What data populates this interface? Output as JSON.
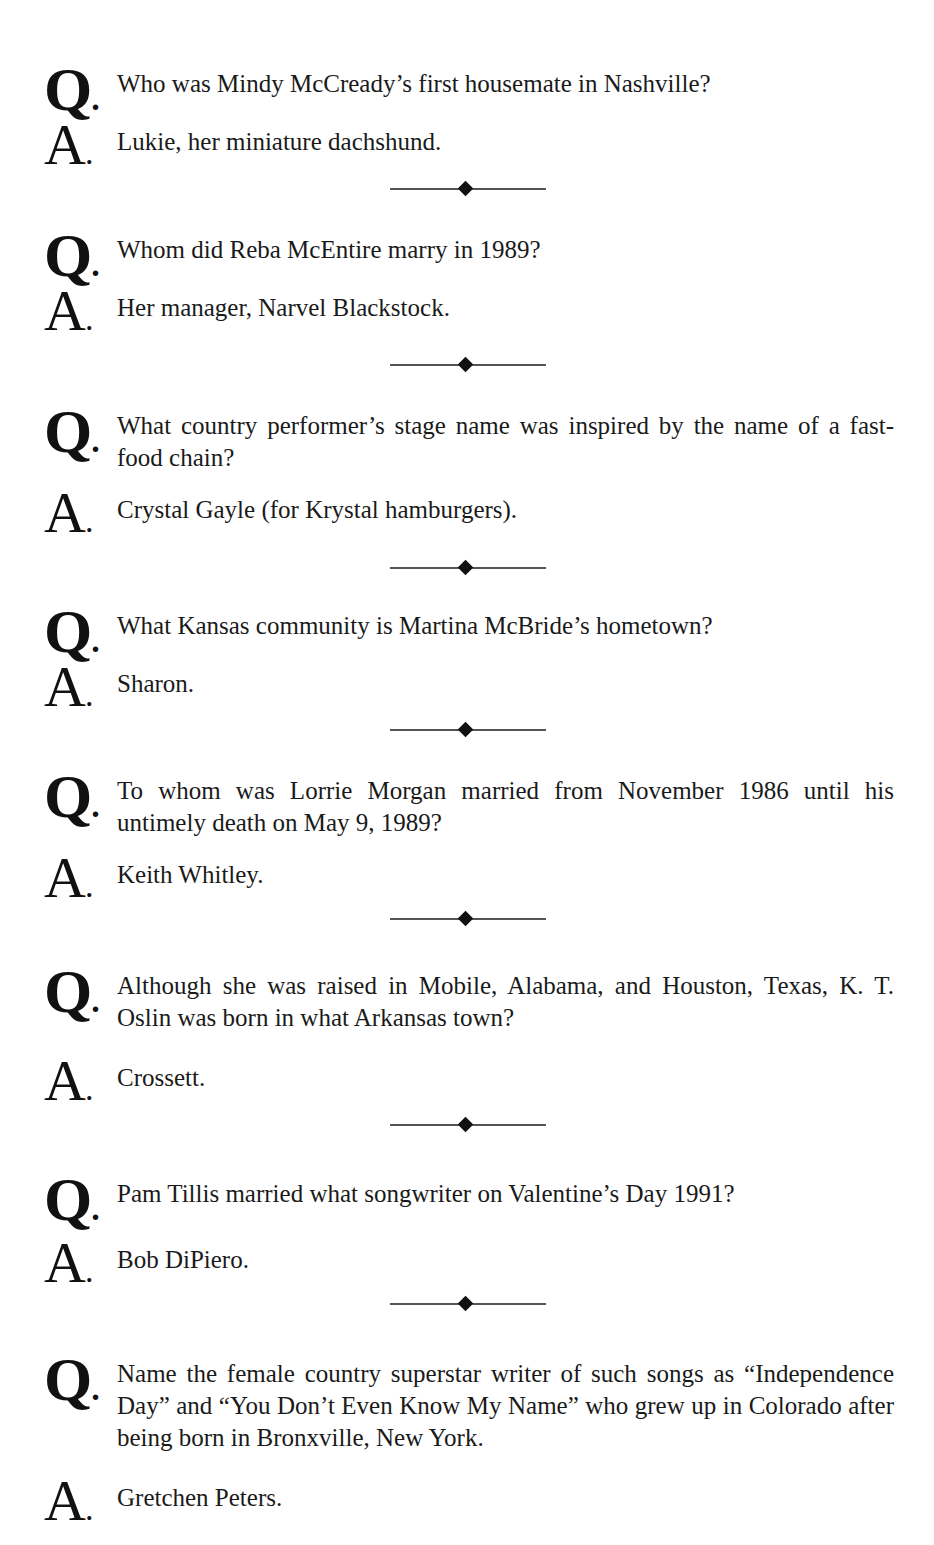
{
  "page": {
    "question_marker": "Q",
    "answer_marker": "A",
    "marker_suffix": ".",
    "divider_icon": "diamond-rule",
    "text_color": "#1a1a1a",
    "divider_line_color": "#555555",
    "divider_diamond_color": "#111111"
  },
  "qa_items": [
    {
      "question": "Who was Mindy McCready’s first housemate in Nashville?",
      "answer": "Lukie, her miniature dachshund."
    },
    {
      "question": "Whom did Reba McEntire marry in 1989?",
      "answer": "Her manager, Narvel Blackstock."
    },
    {
      "question": "What country performer’s stage name was inspired by the name of a fast-food chain?",
      "answer": "Crystal Gayle (for Krystal hamburgers)."
    },
    {
      "question": "What Kansas community is Martina McBride’s hometown?",
      "answer": "Sharon."
    },
    {
      "question": "To whom was Lorrie Morgan married from November 1986 until his untimely death on May 9, 1989?",
      "answer": "Keith Whitley."
    },
    {
      "question": "Although she was raised in Mobile, Alabama, and Houston, Texas, K. T. Oslin was born in what Arkansas town?",
      "answer": "Crossett."
    },
    {
      "question": "Pam Tillis married what songwriter on Valentine’s Day 1991?",
      "answer": "Bob DiPiero."
    },
    {
      "question": "Name the female country superstar writer of such songs as “Independence Day” and “You Don’t Even Know My Name” who grew up in Colorado after being born in Bronxville, New York.",
      "answer": "Gretchen Peters."
    }
  ]
}
